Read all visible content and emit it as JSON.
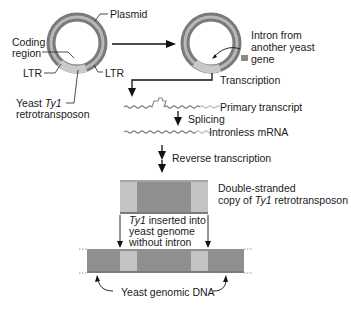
{
  "diagram": {
    "labels": {
      "plasmid": "Plasmid",
      "coding_region_1": "Coding",
      "coding_region_2": "region",
      "ltr_left": "LTR",
      "ltr_right": "LTR",
      "yeast_ty1_prefix": "Yeast ",
      "yeast_ty1_italic": "Ty1",
      "retrotransposon": "retrotransposon",
      "intron_1": "Intron from",
      "intron_2": "another yeast",
      "intron_3": "gene",
      "transcription": "Transcription",
      "primary_transcript": "Primary transcript",
      "splicing": "Splicing",
      "intronless_mrna": "Intronless mRNA",
      "reverse_transcription": "Reverse transcription",
      "ds_copy_1": "Double-stranded",
      "ds_copy_2_prefix": "copy of ",
      "ds_copy_2_italic": "Ty1",
      "ds_copy_2_suffix": " retrotransposon",
      "inserted_1_italic": "Ty1",
      "inserted_1_suffix": " inserted into",
      "inserted_2": "yeast genome",
      "inserted_3": "without intron",
      "genomic_dna": "Yeast genomic DNA"
    },
    "colors": {
      "ring_dark": "#6e6e6e",
      "ring_light": "#c8c8c8",
      "dna_dark": "#8f8f8f",
      "ltr_light": "#c4c4c4",
      "arrow": "#1a1a1a"
    }
  }
}
